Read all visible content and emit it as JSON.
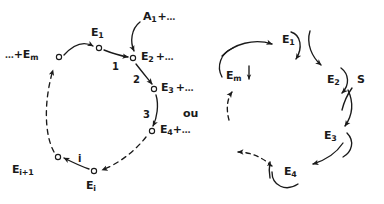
{
  "figure": {
    "ink_color": "#1a1a1a",
    "background_color": "#ffffff",
    "connector_word": "ou"
  },
  "left_diagram": {
    "name": "left-cycle",
    "nodes": [
      {
        "id": "n-em",
        "label_html": "…+E<sub>m</sub>",
        "label_text": "...+E_m",
        "x": 59,
        "y": 57,
        "label_x": 6,
        "label_y": 50,
        "marker": "open-circle"
      },
      {
        "id": "n-e1",
        "label_html": "E<sub>1</sub>",
        "label_text": "E_1",
        "x": 99,
        "y": 48,
        "label_x": 91,
        "label_y": 29,
        "marker": "open-circle"
      },
      {
        "id": "n-e2",
        "label_html": "E<sub>2</sub> +…",
        "label_text": "E_2 +...",
        "x": 133,
        "y": 58,
        "label_x": 142,
        "label_y": 50,
        "marker": "open-circle"
      },
      {
        "id": "n-e3",
        "label_html": "E<sub>3</sub> +…",
        "label_text": "E_3 +...",
        "x": 154,
        "y": 89,
        "label_x": 162,
        "label_y": 82,
        "marker": "open-circle"
      },
      {
        "id": "n-e4",
        "label_html": "E<sub>4</sub>+…",
        "label_text": "E_4+...",
        "x": 152,
        "y": 131,
        "label_x": 160,
        "label_y": 125,
        "marker": "open-circle"
      },
      {
        "id": "n-ei",
        "label_html": "E<sub>i</sub>",
        "label_text": "E_i",
        "x": 94,
        "y": 171,
        "label_x": 87,
        "label_y": 180,
        "marker": "open-circle"
      },
      {
        "id": "n-ei1",
        "label_html": "E<sub>i+1</sub>",
        "label_text": "E_i+1",
        "x": 58,
        "y": 157,
        "label_x": 12,
        "label_y": 165,
        "marker": "open-circle"
      }
    ],
    "step_labels": [
      {
        "id": "step-1",
        "text": "1",
        "x": 113,
        "y": 56
      },
      {
        "id": "step-2",
        "text": "2",
        "x": 134,
        "y": 76
      },
      {
        "id": "step-3",
        "text": "3",
        "x": 146,
        "y": 112
      },
      {
        "id": "step-i",
        "text": "i",
        "x": 79,
        "y": 157
      }
    ],
    "input_label": {
      "id": "input-a1",
      "label_html": "A<sub>1</sub> +…",
      "label_text": "A_1 +...",
      "x": 143,
      "y": 13
    }
  },
  "right_diagram": {
    "name": "right-cycle",
    "nodes": [
      {
        "id": "r-e1",
        "label_html": "E<sub>1</sub>",
        "label_text": "E_1",
        "label_x": 283,
        "label_y": 38
      },
      {
        "id": "r-e2",
        "label_html": "E<sub>2</sub>",
        "label_text": "E_2",
        "label_x": 328,
        "label_y": 78
      },
      {
        "id": "r-e3",
        "label_html": "E<sub>3</sub>",
        "label_text": "E_3",
        "label_x": 325,
        "label_y": 134
      },
      {
        "id": "r-e4",
        "label_html": "E<sub>4</sub>",
        "label_text": "E_4",
        "label_x": 285,
        "label_y": 170
      },
      {
        "id": "r-em",
        "label_html": "E<sub>m</sub>",
        "label_text": "E_m",
        "label_x": 226,
        "label_y": 74
      }
    ],
    "substrate_label": {
      "id": "substrate-s",
      "text": "S",
      "x": 358,
      "y": 78
    }
  },
  "separator": {
    "id": "ou-label",
    "text": "ou",
    "x": 184,
    "y": 110
  }
}
